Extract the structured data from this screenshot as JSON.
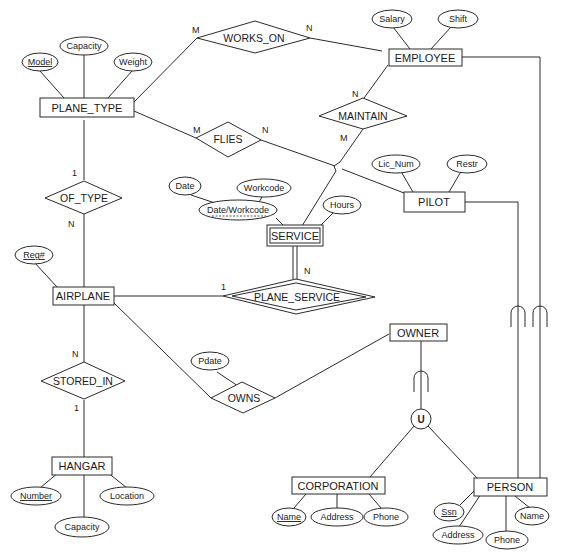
{
  "diagram": {
    "entities": {
      "plane_type": "PLANE_TYPE",
      "employee": "EMPLOYEE",
      "pilot": "PILOT",
      "service": "SERVICE",
      "airplane": "AIRPLANE",
      "owner": "OWNER",
      "hangar": "HANGAR",
      "corporation": "CORPORATION",
      "person": "PERSON"
    },
    "relationships": {
      "works_on": "WORKS_ON",
      "flies": "FLIES",
      "maintain": "MAINTAIN",
      "of_type": "OF_TYPE",
      "plane_service": "PLANE_SERVICE",
      "stored_in": "STORED_IN",
      "owns": "OWNS",
      "union": "U"
    },
    "attributes": {
      "plane_type": {
        "model": "Model",
        "capacity": "Capacity",
        "weight": "Weight"
      },
      "employee": {
        "salary": "Salary",
        "shift": "Shift"
      },
      "pilot": {
        "lic_num": "Lic_Num",
        "restr": "Restr"
      },
      "service": {
        "date": "Date",
        "workcode": "Workcode",
        "date_workcode": "Date/Workcode",
        "hours": "Hours"
      },
      "airplane": {
        "reg": "Reg#"
      },
      "owns": {
        "pdate": "Pdate"
      },
      "hangar": {
        "number": "Number",
        "location": "Location",
        "capacity": "Capacity"
      },
      "corporation": {
        "name": "Name",
        "address": "Address",
        "phone": "Phone"
      },
      "person": {
        "ssn": "Ssn",
        "address": "Address",
        "phone": "Phone",
        "name": "Name"
      }
    },
    "cardinalities": {
      "works_on_plane_type": "M",
      "works_on_employee": "N",
      "flies_plane_type": "M",
      "flies_pilot": "N",
      "maintain_employee": "N",
      "maintain_service": "M",
      "of_type_plane_type": "1",
      "of_type_airplane": "N",
      "plane_service_airplane": "1",
      "plane_service_service": "N",
      "stored_in_airplane": "N",
      "stored_in_hangar": "1"
    }
  }
}
